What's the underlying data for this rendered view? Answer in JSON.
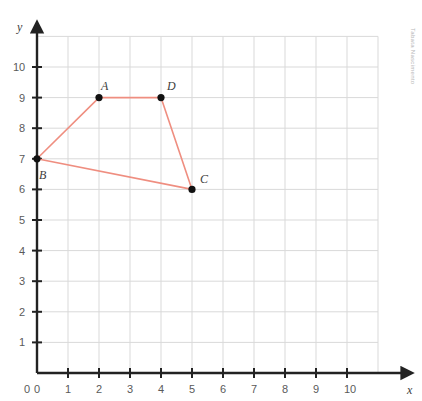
{
  "figure": {
    "background_color": "#ffffff",
    "watermark": "Tabata Nascimento"
  },
  "axes": {
    "x_name": "x",
    "y_name": "y",
    "origin_label": "0",
    "axis_color": "#3d3d3d",
    "grid_color": "#d9d9d9",
    "tick_label_color": "#5a5a5a"
  },
  "chart_data": {
    "type": "scatter",
    "title": "",
    "xlabel": "x",
    "ylabel": "y",
    "xlim": [
      0,
      11
    ],
    "ylim": [
      0,
      11
    ],
    "grid": true,
    "legend": "none",
    "xticks": [
      "0",
      "1",
      "2",
      "3",
      "4",
      "5",
      "6",
      "7",
      "8",
      "9",
      "10"
    ],
    "yticks": [
      "1",
      "2",
      "3",
      "4",
      "5",
      "6",
      "7",
      "8",
      "9",
      "10"
    ],
    "series": [
      {
        "name": "quadrilateral-ABDC",
        "kind": "closed-polygon",
        "line_color": "#ef8e80",
        "marker_color": "#111111",
        "points": [
          {
            "label": "B",
            "x": 0,
            "y": 7,
            "label_dx": 2,
            "label_dy": 10
          },
          {
            "label": "A",
            "x": 2,
            "y": 9,
            "label_dx": 2,
            "label_dy": -18
          },
          {
            "label": "D",
            "x": 4,
            "y": 9,
            "label_dx": 6,
            "label_dy": -18
          },
          {
            "label": "C",
            "x": 5,
            "y": 6,
            "label_dx": 8,
            "label_dy": -16
          }
        ]
      }
    ]
  }
}
